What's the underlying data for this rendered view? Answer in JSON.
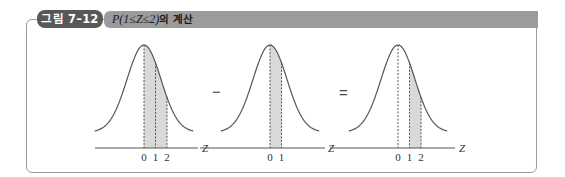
{
  "figure": {
    "badge": "그림 7–12",
    "title_math": "P(1≤Z≤2)",
    "title_suffix": "의 계산",
    "colors": {
      "badge_bg": "#585858",
      "header_bg": "#9b9b9b",
      "shade": "#d9d9d9",
      "curve": "#555555",
      "frame": "#9c9c9c"
    }
  },
  "operators": [
    "−",
    "="
  ],
  "chart_data": [
    {
      "type": "area",
      "title": "",
      "xlabel": "Z",
      "distribution": "standard normal",
      "dashed_lines_at": [
        0,
        1,
        2
      ],
      "shaded_range": [
        0,
        2
      ],
      "tick_labels": [
        "0",
        "1",
        "2"
      ]
    },
    {
      "type": "area",
      "title": "",
      "xlabel": "Z",
      "distribution": "standard normal",
      "dashed_lines_at": [
        0,
        1
      ],
      "shaded_range": [
        0,
        1
      ],
      "tick_labels": [
        "0",
        "1"
      ]
    },
    {
      "type": "area",
      "title": "",
      "xlabel": "Z",
      "distribution": "standard normal",
      "dashed_lines_at": [
        0,
        1,
        2
      ],
      "shaded_range": [
        1,
        2
      ],
      "tick_labels": [
        "0",
        "1",
        "2"
      ]
    }
  ]
}
